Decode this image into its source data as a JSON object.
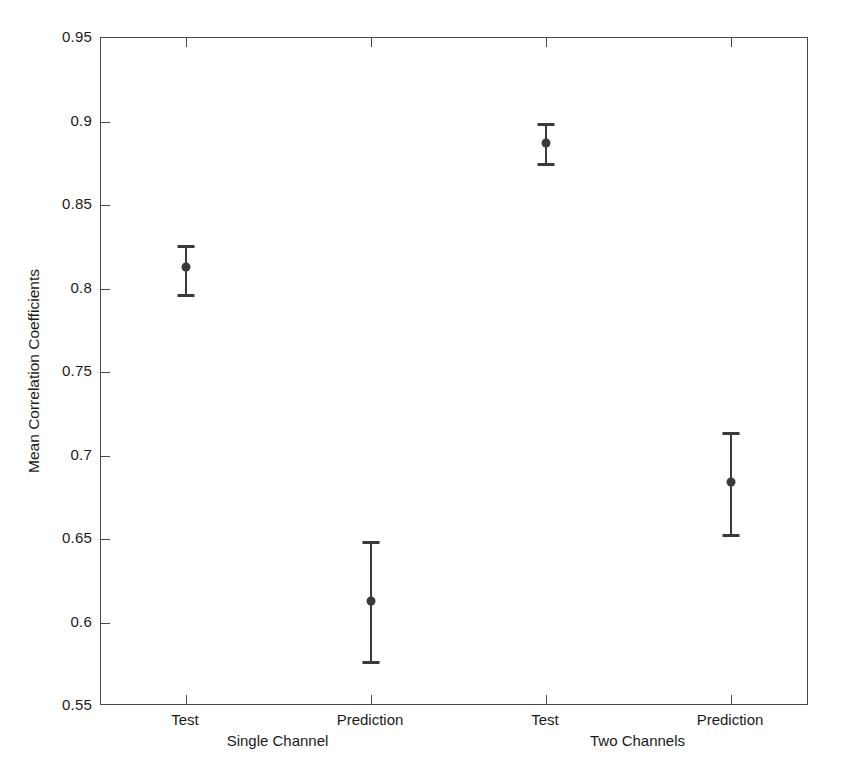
{
  "chart_data": {
    "type": "scatter",
    "title": "",
    "xlabel": "",
    "ylabel": "Mean Correlation Coefficients",
    "ylim": [
      0.55,
      0.95
    ],
    "yticks": [
      "0.55",
      "0.6",
      "0.65",
      "0.7",
      "0.75",
      "0.8",
      "0.85",
      "0.9",
      "0.95"
    ],
    "ytick_values": [
      0.55,
      0.6,
      0.65,
      0.7,
      0.75,
      0.8,
      0.85,
      0.9,
      0.95
    ],
    "grid": false,
    "legend": "none",
    "categories": [
      "Test",
      "Prediction",
      "Test",
      "Prediction"
    ],
    "groups": [
      {
        "label": "Single Channel",
        "categories": [
          "Test",
          "Prediction"
        ]
      },
      {
        "label": "Two Channels",
        "categories": [
          "Test",
          "Prediction"
        ]
      }
    ],
    "series": [
      {
        "name": "Mean Correlation Coefficients",
        "values": [
          0.813,
          0.613,
          0.887,
          0.684
        ],
        "error_upper": [
          0.826,
          0.649,
          0.899,
          0.714
        ],
        "error_lower": [
          0.797,
          0.577,
          0.875,
          0.653
        ]
      }
    ],
    "points": [
      {
        "group": "Single Channel",
        "category": "Test",
        "mean": 0.813,
        "upper": 0.826,
        "lower": 0.797
      },
      {
        "group": "Single Channel",
        "category": "Prediction",
        "mean": 0.613,
        "upper": 0.649,
        "lower": 0.577
      },
      {
        "group": "Two Channels",
        "category": "Test",
        "mean": 0.887,
        "upper": 0.899,
        "lower": 0.875
      },
      {
        "group": "Two Channels",
        "category": "Prediction",
        "mean": 0.684,
        "upper": 0.714,
        "lower": 0.653
      }
    ],
    "marker_color": "#3a3a3a",
    "axis_color": "#4a4a4a",
    "background_color": "#ffffff"
  }
}
